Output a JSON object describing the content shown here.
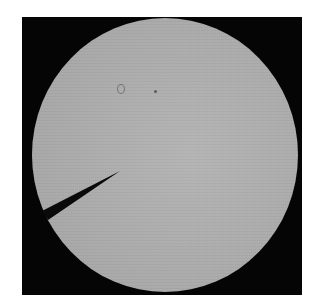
{
  "image": {
    "description": "Brightfield microscope view: circular illuminated field on black background with a dark micropipette/needle entering from the lower-left",
    "colors": {
      "background": "#ffffff",
      "frame": "#050505",
      "field": "#adadad",
      "needle": "#0a0a0a"
    }
  }
}
